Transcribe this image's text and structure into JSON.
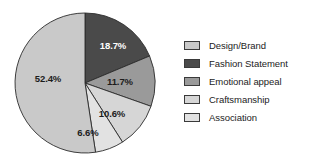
{
  "chart_data": {
    "type": "pie",
    "title": "",
    "subtitle": "",
    "xlabel": "",
    "ylabel": "",
    "grid": false,
    "legend_position": "right",
    "start_angle_deg": 0,
    "direction": "clockwise",
    "categories": [
      "Design/Brand",
      "Fashion Statement",
      "Emotional appeal",
      "Craftsmanship",
      "Association"
    ],
    "values": [
      52.4,
      18.7,
      11.7,
      10.6,
      6.6
    ],
    "value_unit": "%",
    "data_labels": [
      "52.4%",
      "18.7%",
      "11.7%",
      "10.6%",
      "6.6%"
    ],
    "colors": [
      "#c9c9c9",
      "#4a4a4a",
      "#9a9a9a",
      "#d6d6d6",
      "#e2e2e2"
    ],
    "label_text_colors": [
      "#1c1c1c",
      "#ffffff",
      "#1c1c1c",
      "#1c1c1c",
      "#1c1c1c"
    ],
    "slices": [
      {
        "label": "Fashion Statement",
        "value": 18.7,
        "data_label": "18.7%",
        "color": "#4a4a4a",
        "text_color": "#ffffff",
        "start_deg": 0,
        "end_deg": 67.32,
        "label_x": 113,
        "label_y": 46
      },
      {
        "label": "Emotional appeal",
        "value": 11.7,
        "data_label": "11.7%",
        "color": "#9a9a9a",
        "text_color": "#1c1c1c",
        "start_deg": 67.32,
        "end_deg": 109.44,
        "label_x": 120,
        "label_y": 82
      },
      {
        "label": "Craftsmanship",
        "value": 10.6,
        "data_label": "10.6%",
        "color": "#d6d6d6",
        "text_color": "#1c1c1c",
        "start_deg": 109.44,
        "end_deg": 147.6,
        "label_x": 112,
        "label_y": 114
      },
      {
        "label": "Association",
        "value": 6.6,
        "data_label": "6.6%",
        "color": "#e2e2e2",
        "text_color": "#1c1c1c",
        "start_deg": 147.6,
        "end_deg": 171.36,
        "label_x": 88,
        "label_y": 133
      },
      {
        "label": "Design/Brand",
        "value": 52.4,
        "data_label": "52.4%",
        "color": "#c9c9c9",
        "text_color": "#1c1c1c",
        "start_deg": 171.36,
        "end_deg": 360,
        "label_x": 48,
        "label_y": 79
      }
    ]
  },
  "legend": {
    "items": [
      {
        "label": "Design/Brand",
        "color": "#c9c9c9"
      },
      {
        "label": "Fashion Statement",
        "color": "#4a4a4a"
      },
      {
        "label": "Emotional appeal",
        "color": "#9a9a9a"
      },
      {
        "label": "Craftsmanship",
        "color": "#d6d6d6"
      },
      {
        "label": "Association",
        "color": "#e2e2e2"
      }
    ]
  },
  "geometry": {
    "center_x": 85,
    "center_y": 83,
    "radius": 70
  }
}
